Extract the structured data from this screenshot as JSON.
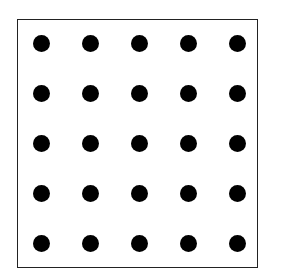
{
  "diagram": {
    "type": "dot-grid",
    "rows": 5,
    "cols": 5,
    "dot_color": "#000000",
    "frame_color": "#222222",
    "background": "#ffffff",
    "frame": {
      "left": 17,
      "top": 19,
      "width": 241,
      "height": 249
    },
    "grid": {
      "x0": 41,
      "y0": 43,
      "dx": 49,
      "dy": 50,
      "dot_diameter": 17
    }
  }
}
